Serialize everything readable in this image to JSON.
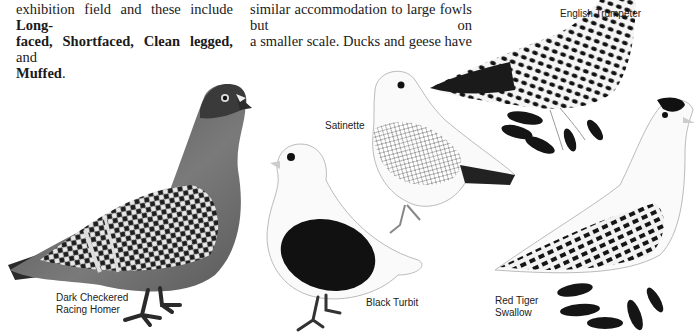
{
  "text": {
    "left_column": {
      "line1": "exhibition field and these include",
      "line1_bold": "Long-",
      "line2_bold_a": "faced,",
      "line2_bold_b": "Shortfaced,",
      "line2_bold_c": "Clean legged,",
      "line2_tail": "and",
      "line3_bold": "Muffed",
      "line3_tail": "."
    },
    "right_column": {
      "line1": "similar accommodation to large fowls but on",
      "line2": "a smaller scale. Ducks and geese have"
    }
  },
  "captions": {
    "english_trumpeter": "English Trumpeter",
    "satinette": "Satinette",
    "racing_homer_line1": "Dark Checkered",
    "racing_homer_line2": "Racing Homer",
    "black_turbit": "Black Turbit",
    "red_tiger_swallow_line1": "Red Tiger",
    "red_tiger_swallow_line2": "Swallow"
  },
  "colors": {
    "ink": "#1a1a1a",
    "paper": "#ffffff",
    "grey_body": "#6e6e6e",
    "dark_head": "#3a3a3a"
  }
}
